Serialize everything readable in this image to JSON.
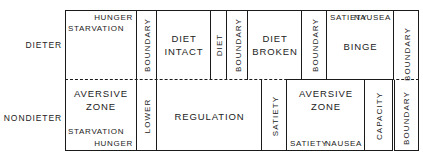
{
  "figure": {
    "row_labels": [
      {
        "name": "dieter",
        "text": "DIETER"
      },
      {
        "name": "nondieter",
        "text": "NONDIETER"
      }
    ]
  },
  "top_row": {
    "starvation_cell": {
      "corner_top_right": "HUNGER",
      "corner_left": "STARVATION"
    },
    "boundary_1": "BOUNDARY",
    "diet_intact": {
      "line1": "DIET",
      "line2": "INTACT"
    },
    "diet_column": "DIET",
    "boundary_2": "BOUNDARY",
    "diet_broken": {
      "line1": "DIET",
      "line2": "BROKEN"
    },
    "boundary_3": "BOUNDARY",
    "binge": {
      "corner_left": "SATIETY",
      "corner_right": "NAUSEA",
      "center": "BINGE"
    },
    "boundary_4": "BOUNDARY"
  },
  "bottom_row": {
    "aversive_zone_left": {
      "line1": "AVERSIVE",
      "line2": "ZONE",
      "corner_left": "STARVATION",
      "corner_right": "HUNGER"
    },
    "lower_column": "LOWER",
    "regulation": "REGULATION",
    "satiety_column": "SATIETY",
    "aversive_zone_right": {
      "line1": "AVERSIVE",
      "line2": "ZONE",
      "corner_left": "SATIETY",
      "corner_right": "NAUSEA"
    },
    "capacity_column": "CAPACITY"
  },
  "colors": {
    "line": "#1a1a1a",
    "text": "#222222",
    "background": "#ffffff"
  }
}
